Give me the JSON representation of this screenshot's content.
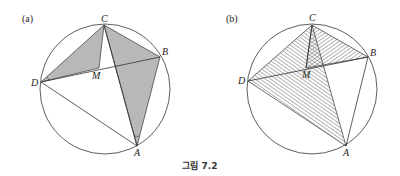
{
  "figure": {
    "caption": "그림 7.2",
    "panels": [
      {
        "label": "(a)",
        "points": {
          "A": "A",
          "B": "B",
          "C": "C",
          "D": "D",
          "M": "M"
        },
        "shading": "gray-filled triangles DCM and CBA"
      },
      {
        "label": "(b)",
        "points": {
          "A": "A",
          "B": "B",
          "C": "C",
          "D": "D",
          "M": "M"
        },
        "shading": "hatched triangles DCA and CMB"
      }
    ]
  },
  "colors": {
    "stroke": "#333333",
    "fill": "#b8b8b8",
    "hatch": "#555555"
  }
}
